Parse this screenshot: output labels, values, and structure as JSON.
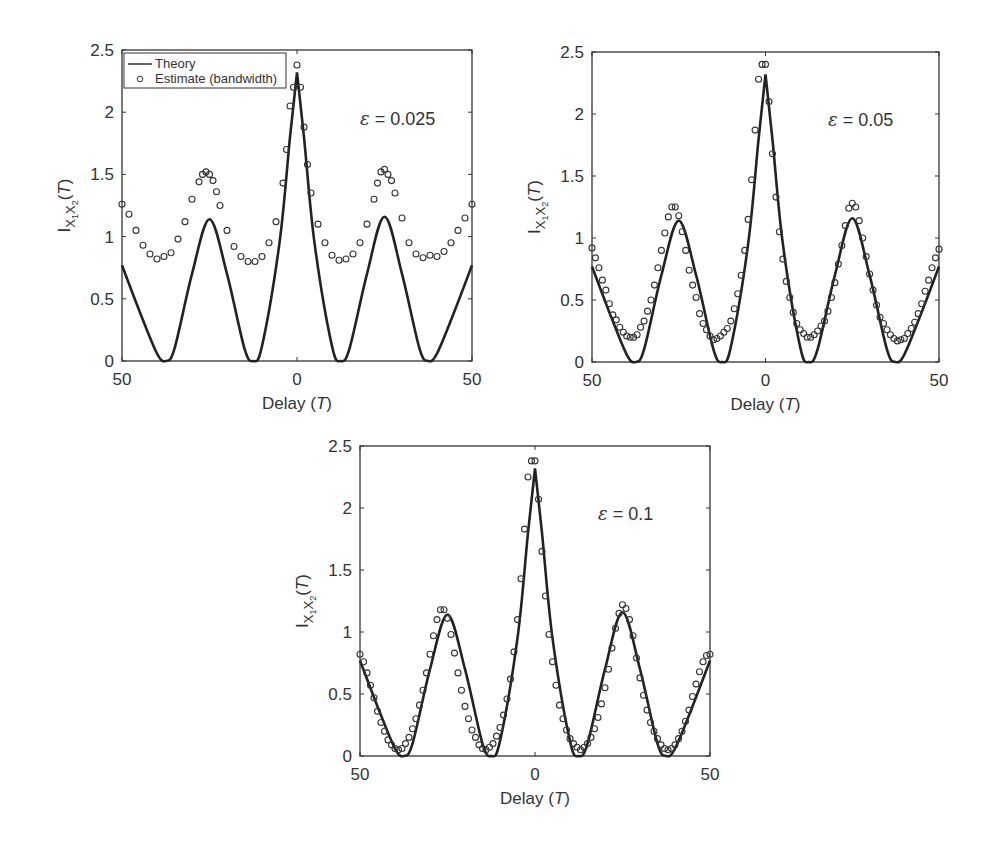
{
  "figure": {
    "panels": [
      {
        "id": "panel-eps-0025",
        "annotation": "ε = 0.025",
        "xlabel": "Delay (T)",
        "ylabel": "I_{X1X2}(T)",
        "show_legend": true
      },
      {
        "id": "panel-eps-005",
        "annotation": "ε = 0.05",
        "xlabel": "Delay (T)",
        "ylabel": "I_{X1X2}(T)",
        "show_legend": false
      },
      {
        "id": "panel-eps-01",
        "annotation": "ε = 0.1",
        "xlabel": "Delay (T)",
        "ylabel": "I_{X1X2}(T)",
        "show_legend": false
      }
    ],
    "legend": {
      "theory": "Theory",
      "estimate": "Estimate (bandwidth)"
    },
    "xticks": [
      "50",
      "0",
      "50"
    ],
    "yticks": [
      "0",
      "0.5",
      "1",
      "1.5",
      "2",
      "2.5"
    ],
    "line_color": "#222222",
    "marker_color": "#333333"
  },
  "chart_data": [
    {
      "type": "line",
      "title": "ε = 0.025",
      "xlabel": "Delay (T)",
      "ylabel": "I_{X1X2}(T)",
      "xlim": [
        -50,
        50
      ],
      "ylim": [
        0,
        2.5
      ],
      "xtick_labels": [
        "50",
        "0",
        "50"
      ],
      "ytick_labels": [
        "0",
        "0.5",
        "1",
        "1.5",
        "2",
        "2.5"
      ],
      "legend": [
        "Theory",
        "Estimate (bandwidth)"
      ],
      "legend_position": "upper left",
      "series": [
        {
          "name": "Theory",
          "style": "line",
          "x": [
            -50,
            -45,
            -40,
            -37.5,
            -35,
            -30,
            -25,
            -20,
            -15,
            -12.5,
            -10,
            -5,
            -2,
            0,
            2,
            5,
            10,
            12.5,
            15,
            20,
            25,
            30,
            35,
            37.5,
            40,
            45,
            50
          ],
          "y": [
            0.77,
            0.4,
            0.06,
            0,
            0.1,
            0.7,
            1.14,
            0.7,
            0.1,
            0,
            0.12,
            0.95,
            1.8,
            2.32,
            1.8,
            0.95,
            0.12,
            0,
            0.1,
            0.7,
            1.16,
            0.7,
            0.1,
            0,
            0.06,
            0.4,
            0.77
          ]
        },
        {
          "name": "Estimate (bandwidth)",
          "style": "markers",
          "x": [
            -50,
            -48,
            -46,
            -44,
            -42,
            -40,
            -38,
            -36,
            -34,
            -32,
            -30,
            -28,
            -27,
            -26,
            -25,
            -24,
            -23,
            -22,
            -20,
            -18,
            -16,
            -14,
            -12,
            -10,
            -8,
            -6,
            -4,
            -3,
            -2,
            -1,
            0,
            1,
            2,
            3,
            4,
            6,
            8,
            10,
            12,
            14,
            16,
            18,
            20,
            22,
            23,
            24,
            25,
            26,
            27,
            28,
            30,
            32,
            34,
            36,
            38,
            40,
            42,
            44,
            46,
            48,
            50
          ],
          "y": [
            1.26,
            1.18,
            1.05,
            0.93,
            0.86,
            0.82,
            0.84,
            0.87,
            0.98,
            1.12,
            1.3,
            1.44,
            1.5,
            1.52,
            1.5,
            1.45,
            1.36,
            1.25,
            1.05,
            0.92,
            0.84,
            0.8,
            0.8,
            0.84,
            0.95,
            1.12,
            1.43,
            1.7,
            2.05,
            2.2,
            2.38,
            2.2,
            1.88,
            1.58,
            1.35,
            1.1,
            0.95,
            0.85,
            0.81,
            0.82,
            0.86,
            0.95,
            1.1,
            1.3,
            1.43,
            1.52,
            1.54,
            1.5,
            1.45,
            1.35,
            1.15,
            0.95,
            0.86,
            0.83,
            0.85,
            0.84,
            0.88,
            0.95,
            1.05,
            1.15,
            1.26
          ]
        }
      ]
    },
    {
      "type": "line",
      "title": "ε = 0.05",
      "xlabel": "Delay (T)",
      "ylabel": "I_{X1X2}(T)",
      "xlim": [
        -50,
        50
      ],
      "ylim": [
        0,
        2.5
      ],
      "xtick_labels": [
        "50",
        "0",
        "50"
      ],
      "ytick_labels": [
        "0",
        "0.5",
        "1",
        "1.5",
        "2",
        "2.5"
      ],
      "series": [
        {
          "name": "Theory",
          "style": "line",
          "x": [
            -50,
            -45,
            -40,
            -37.5,
            -35,
            -30,
            -25,
            -20,
            -15,
            -12.5,
            -10,
            -5,
            -2,
            0,
            2,
            5,
            10,
            12.5,
            15,
            20,
            25,
            30,
            35,
            37.5,
            40,
            45,
            50
          ],
          "y": [
            0.77,
            0.4,
            0.06,
            0,
            0.1,
            0.7,
            1.14,
            0.7,
            0.1,
            0,
            0.12,
            0.95,
            1.8,
            2.32,
            1.8,
            0.95,
            0.12,
            0,
            0.1,
            0.7,
            1.16,
            0.7,
            0.1,
            0,
            0.06,
            0.4,
            0.77
          ]
        },
        {
          "name": "Estimate (bandwidth)",
          "style": "markers",
          "x": [
            -50,
            -49,
            -48,
            -47,
            -46,
            -45,
            -44,
            -43,
            -42,
            -41,
            -40,
            -39,
            -38,
            -37,
            -36,
            -35,
            -34,
            -33,
            -32,
            -31,
            -30,
            -29,
            -28,
            -27,
            -26,
            -25,
            -24,
            -23,
            -22,
            -21,
            -20,
            -19,
            -18,
            -17,
            -16,
            -15,
            -14,
            -13,
            -12,
            -11,
            -10,
            -9,
            -8,
            -7,
            -6,
            -5,
            -4,
            -3,
            -2,
            -1,
            0,
            1,
            2,
            3,
            4,
            5,
            6,
            7,
            8,
            9,
            10,
            11,
            12,
            13,
            14,
            15,
            16,
            17,
            18,
            19,
            20,
            21,
            22,
            23,
            24,
            25,
            26,
            27,
            28,
            29,
            30,
            31,
            32,
            33,
            34,
            35,
            36,
            37,
            38,
            39,
            40,
            41,
            42,
            43,
            44,
            45,
            46,
            47,
            48,
            49,
            50
          ],
          "y": [
            0.92,
            0.84,
            0.76,
            0.66,
            0.58,
            0.47,
            0.38,
            0.34,
            0.28,
            0.24,
            0.21,
            0.2,
            0.2,
            0.22,
            0.28,
            0.33,
            0.41,
            0.5,
            0.62,
            0.76,
            0.9,
            1.04,
            1.17,
            1.25,
            1.25,
            1.18,
            1.05,
            0.9,
            0.74,
            0.62,
            0.52,
            0.39,
            0.31,
            0.26,
            0.21,
            0.18,
            0.19,
            0.21,
            0.24,
            0.27,
            0.33,
            0.43,
            0.55,
            0.7,
            0.9,
            1.15,
            1.47,
            1.87,
            2.28,
            2.4,
            2.4,
            2.1,
            1.68,
            1.33,
            1.05,
            0.83,
            0.65,
            0.52,
            0.4,
            0.31,
            0.26,
            0.23,
            0.2,
            0.2,
            0.22,
            0.25,
            0.29,
            0.33,
            0.41,
            0.52,
            0.64,
            0.79,
            0.94,
            1.1,
            1.24,
            1.28,
            1.25,
            1.14,
            1.0,
            0.85,
            0.71,
            0.58,
            0.46,
            0.36,
            0.31,
            0.26,
            0.22,
            0.19,
            0.17,
            0.18,
            0.19,
            0.23,
            0.27,
            0.32,
            0.39,
            0.47,
            0.57,
            0.66,
            0.76,
            0.84,
            0.91
          ]
        }
      ]
    },
    {
      "type": "line",
      "title": "ε = 0.1",
      "xlabel": "Delay (T)",
      "ylabel": "I_{X1X2}(T)",
      "xlim": [
        -50,
        50
      ],
      "ylim": [
        0,
        2.5
      ],
      "xtick_labels": [
        "50",
        "0",
        "50"
      ],
      "ytick_labels": [
        "0",
        "0.5",
        "1",
        "1.5",
        "2",
        "2.5"
      ],
      "series": [
        {
          "name": "Theory",
          "style": "line",
          "x": [
            -50,
            -45,
            -40,
            -37.5,
            -35,
            -30,
            -25,
            -20,
            -15,
            -12.5,
            -10,
            -5,
            -2,
            0,
            2,
            5,
            10,
            12.5,
            15,
            20,
            25,
            30,
            35,
            37.5,
            40,
            45,
            50
          ],
          "y": [
            0.77,
            0.4,
            0.06,
            0,
            0.1,
            0.7,
            1.14,
            0.7,
            0.1,
            0,
            0.12,
            0.95,
            1.8,
            2.32,
            1.8,
            0.95,
            0.12,
            0,
            0.1,
            0.7,
            1.16,
            0.7,
            0.1,
            0,
            0.06,
            0.4,
            0.77
          ]
        },
        {
          "name": "Estimate (bandwidth)",
          "style": "markers",
          "x": [
            -50,
            -49,
            -48,
            -47,
            -46,
            -45,
            -44,
            -43,
            -42,
            -41,
            -40,
            -39,
            -38,
            -37,
            -36,
            -35,
            -34,
            -33,
            -32,
            -31,
            -30,
            -29,
            -28,
            -27,
            -26,
            -25,
            -24,
            -23,
            -22,
            -21,
            -20,
            -19,
            -18,
            -17,
            -16,
            -15,
            -14,
            -13,
            -12,
            -11,
            -10,
            -9,
            -8,
            -7,
            -6,
            -5,
            -4,
            -3,
            -2,
            -1,
            0,
            1,
            2,
            3,
            4,
            5,
            6,
            7,
            8,
            9,
            10,
            11,
            12,
            13,
            14,
            15,
            16,
            17,
            18,
            19,
            20,
            21,
            22,
            23,
            24,
            25,
            26,
            27,
            28,
            29,
            30,
            31,
            32,
            33,
            34,
            35,
            36,
            37,
            38,
            39,
            40,
            41,
            42,
            43,
            44,
            45,
            46,
            47,
            48,
            49,
            50
          ],
          "y": [
            0.82,
            0.76,
            0.67,
            0.57,
            0.47,
            0.36,
            0.27,
            0.2,
            0.13,
            0.09,
            0.06,
            0.05,
            0.06,
            0.1,
            0.15,
            0.22,
            0.3,
            0.41,
            0.53,
            0.67,
            0.82,
            0.97,
            1.1,
            1.18,
            1.18,
            1.11,
            0.98,
            0.83,
            0.67,
            0.53,
            0.4,
            0.3,
            0.21,
            0.15,
            0.09,
            0.06,
            0.05,
            0.07,
            0.1,
            0.16,
            0.23,
            0.33,
            0.46,
            0.62,
            0.84,
            1.1,
            1.43,
            1.83,
            2.25,
            2.38,
            2.38,
            2.07,
            1.65,
            1.29,
            0.98,
            0.76,
            0.57,
            0.41,
            0.3,
            0.21,
            0.14,
            0.1,
            0.07,
            0.05,
            0.07,
            0.1,
            0.15,
            0.22,
            0.31,
            0.42,
            0.55,
            0.7,
            0.87,
            1.03,
            1.15,
            1.22,
            1.19,
            1.1,
            0.97,
            0.79,
            0.63,
            0.49,
            0.37,
            0.27,
            0.2,
            0.14,
            0.09,
            0.06,
            0.05,
            0.06,
            0.09,
            0.14,
            0.2,
            0.28,
            0.37,
            0.48,
            0.58,
            0.68,
            0.76,
            0.81,
            0.82
          ]
        }
      ]
    }
  ]
}
